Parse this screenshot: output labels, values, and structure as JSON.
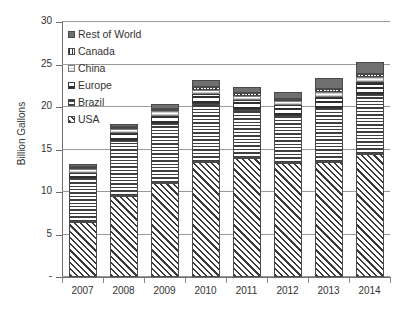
{
  "chart_data": {
    "type": "bar",
    "stacked": true,
    "title": "",
    "xlabel": "",
    "ylabel": "Billion Gallons",
    "ylim": [
      0,
      30
    ],
    "yticks": [
      "-",
      "5",
      "10",
      "15",
      "20",
      "25",
      "30"
    ],
    "ytick_values": [
      0,
      5,
      10,
      15,
      20,
      25,
      30
    ],
    "grid": true,
    "legend_position": "upper-left-inside",
    "categories": [
      "2007",
      "2008",
      "2009",
      "2010",
      "2011",
      "2012",
      "2013",
      "2014"
    ],
    "series": [
      {
        "name": "USA",
        "pattern": "diagonal-hatch",
        "color": "#3a3a3a",
        "values": [
          6.5,
          9.5,
          11.1,
          13.5,
          14.0,
          13.4,
          13.5,
          14.5
        ]
      },
      {
        "name": "Brazil",
        "pattern": "horizontal-lines",
        "color": "#3f3f3f",
        "values": [
          5.0,
          6.5,
          6.9,
          6.9,
          5.7,
          5.6,
          6.3,
          6.9
        ]
      },
      {
        "name": "Europe",
        "pattern": "checker",
        "color": "#2e2e2e",
        "values": [
          0.7,
          0.9,
          1.0,
          1.1,
          1.1,
          1.2,
          1.4,
          1.5
        ]
      },
      {
        "name": "China",
        "pattern": "light-fill",
        "color": "#fbfbfb",
        "values": [
          0.5,
          0.5,
          0.5,
          0.5,
          0.5,
          0.5,
          0.6,
          0.6
        ]
      },
      {
        "name": "Canada",
        "pattern": "fine-dots",
        "color": "#4a4a4a",
        "values": [
          0.2,
          0.2,
          0.3,
          0.3,
          0.3,
          0.3,
          0.3,
          0.4
        ]
      },
      {
        "name": "Rest of World",
        "pattern": "solid-gray",
        "color": "#6f6f6f",
        "values": [
          0.4,
          0.4,
          0.5,
          0.9,
          0.8,
          0.8,
          1.3,
          1.4
        ]
      }
    ],
    "totals": [
      13.3,
      18.0,
      20.3,
      23.2,
      22.4,
      21.8,
      23.4,
      25.3
    ]
  },
  "legend": {
    "items": [
      {
        "label": "Rest of World",
        "key": "row"
      },
      {
        "label": "Canada",
        "key": "canada"
      },
      {
        "label": "China",
        "key": "china"
      },
      {
        "label": "Europe",
        "key": "europe"
      },
      {
        "label": "Brazil",
        "key": "brazil"
      },
      {
        "label": "USA",
        "key": "usa"
      }
    ]
  },
  "axes": {
    "y_title": "Billion Gallons"
  }
}
